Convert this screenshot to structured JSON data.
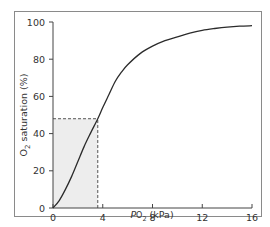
{
  "chart_data": {
    "type": "line",
    "title": "",
    "xlabel": "PO2 (kPa)",
    "xlabel_parts": {
      "italic": "P",
      "main": "O",
      "sub": "2",
      "unit": " (kPa)"
    },
    "ylabel": "O2 saturation (%)",
    "ylabel_parts": {
      "main": "O",
      "sub": "2",
      "rest": " saturation (%)"
    },
    "xlim": [
      0,
      16
    ],
    "ylim": [
      0,
      100
    ],
    "xticks": [
      0,
      4,
      8,
      12,
      16
    ],
    "yticks": [
      0,
      20,
      40,
      60,
      80,
      100
    ],
    "grid": false,
    "legend": null,
    "series": [
      {
        "name": "Oxygen dissociation curve",
        "x": [
          0,
          0.5,
          1,
          1.5,
          2,
          2.5,
          3,
          3.6,
          4,
          4.5,
          5,
          5.5,
          6,
          7,
          8,
          9,
          10,
          11,
          12,
          13,
          14,
          15,
          16
        ],
        "y": [
          0,
          4,
          10,
          17,
          25,
          33,
          40,
          48,
          54,
          61,
          68,
          73,
          77,
          83,
          87,
          90,
          92,
          94,
          95.5,
          96.5,
          97.3,
          97.8,
          98
        ]
      }
    ],
    "annotations": {
      "reference_point": {
        "x": 3.6,
        "y": 48
      },
      "dashed_lines": [
        {
          "from": [
            0,
            48
          ],
          "to": [
            3.6,
            48
          ]
        },
        {
          "from": [
            3.6,
            0
          ],
          "to": [
            3.6,
            48
          ]
        }
      ],
      "shaded_region": {
        "x": [
          0,
          3.6
        ],
        "y": [
          0,
          48
        ],
        "color": "#ededed"
      }
    },
    "colors": {
      "curve": "#2b2b2b",
      "axis": "#444444",
      "dashed": "#555555",
      "frame": "#8a8a8a",
      "shade": "#ededed"
    }
  }
}
